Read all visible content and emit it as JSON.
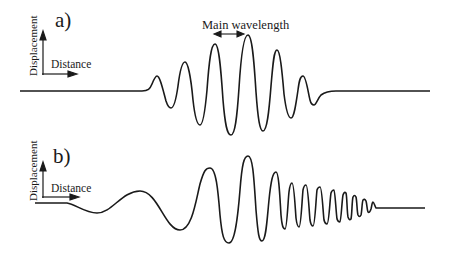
{
  "figure": {
    "panels": [
      {
        "id": "a",
        "label": "a)",
        "ylabel": "Displacement",
        "xlabel": "Distance",
        "annotation": "Main wavelength",
        "description": "Symmetric wave packet with constant wavelength; amplitude grows to a maximum at the centre then decays"
      },
      {
        "id": "b",
        "label": "b)",
        "ylabel": "Displacement",
        "xlabel": "Distance",
        "description": "Dispersed wave train: long-wavelength waves lead, wavelength shortens progressively toward the tail"
      }
    ],
    "colors": {
      "line": "#1a1a1a",
      "background": "#ffffff"
    }
  }
}
